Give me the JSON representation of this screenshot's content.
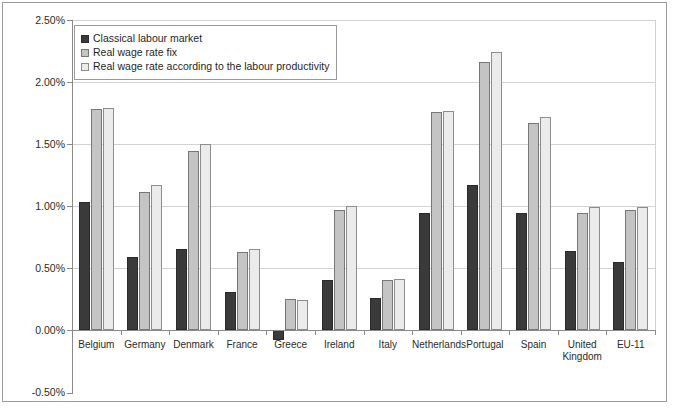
{
  "chart_data": {
    "type": "bar",
    "title": "",
    "xlabel": "",
    "ylabel": "",
    "ylim": [
      -0.5,
      2.5
    ],
    "ytick_labels": [
      "2.50%",
      "2.00%",
      "1.50%",
      "1.00%",
      "0.50%",
      "0.00%",
      "-0.50%"
    ],
    "ytick_values": [
      2.5,
      2.0,
      1.5,
      1.0,
      0.5,
      0.0,
      -0.5
    ],
    "grid": true,
    "legend_position": "top-left",
    "categories": [
      "Belgium",
      "Germany",
      "Denmark",
      "France",
      "Greece",
      "Ireland",
      "Italy",
      "Netherlands",
      "Portugal",
      "Spain",
      "United Kingdom",
      "EU-11"
    ],
    "series": [
      {
        "name": "Classical labour market",
        "color": "#3a3a3a",
        "values": [
          1.03,
          0.59,
          0.65,
          0.31,
          -0.08,
          0.4,
          0.26,
          0.94,
          1.17,
          0.94,
          0.64,
          0.55
        ]
      },
      {
        "name": "Real wage rate fix",
        "color": "#c4c4c4",
        "values": [
          1.78,
          1.11,
          1.44,
          0.63,
          0.25,
          0.97,
          0.4,
          1.76,
          2.16,
          1.67,
          0.94,
          0.97
        ]
      },
      {
        "name": "Real wage rate according to the labour productivity",
        "color": "#ebebeb",
        "values": [
          1.79,
          1.17,
          1.5,
          0.65,
          0.24,
          1.0,
          0.41,
          1.77,
          2.24,
          1.72,
          0.99,
          0.99
        ]
      }
    ]
  },
  "legend": {
    "items": [
      {
        "label": "Classical labour market"
      },
      {
        "label": "Real wage rate fix"
      },
      {
        "label": "Real wage rate according to the labour productivity"
      }
    ]
  }
}
